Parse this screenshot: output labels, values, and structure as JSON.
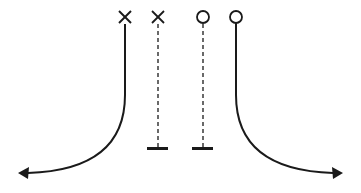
{
  "diagram": {
    "type": "route-diagram",
    "stroke_color": "#1a1a1a",
    "background": "#ffffff",
    "routes": [
      {
        "id": "left-curve",
        "start_marker": "x",
        "line": "solid",
        "end": "arrow-left",
        "x": 125
      },
      {
        "id": "left-straight",
        "start_marker": "x",
        "line": "dashed",
        "end": "t-bar",
        "x": 158
      },
      {
        "id": "right-straight",
        "start_marker": "circle",
        "line": "dashed",
        "end": "t-bar",
        "x": 203
      },
      {
        "id": "right-curve",
        "start_marker": "circle",
        "line": "solid",
        "end": "arrow-right",
        "x": 236
      }
    ]
  }
}
